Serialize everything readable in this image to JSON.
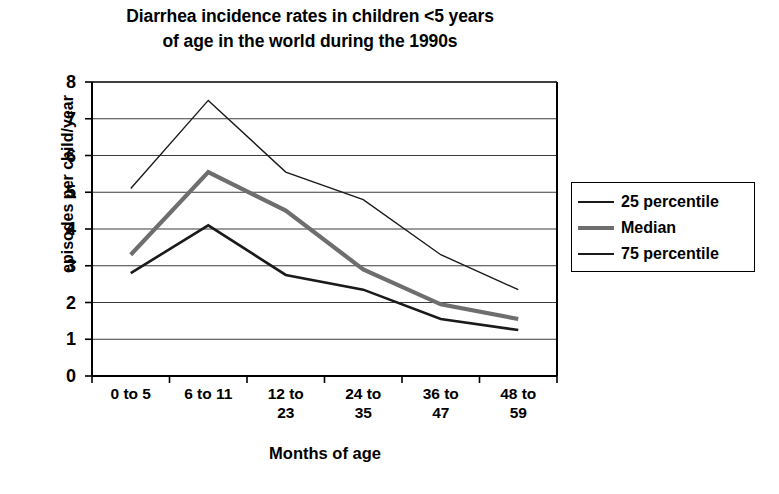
{
  "chart_data": {
    "type": "line",
    "title": "Diarrhea incidence rates in children <5 years\nof age in the world during the 1990s",
    "xlabel": "Months of age",
    "ylabel": "episodes per child/year",
    "categories": [
      "0 to 5",
      "6 to 11",
      "12 to\n23",
      "24 to\n35",
      "36 to\n47",
      "48 to\n59"
    ],
    "categories_plain": [
      "0 to 5",
      "6 to 11",
      "12 to 23",
      "24 to 35",
      "36 to 47",
      "48 to 59"
    ],
    "series": [
      {
        "name": "25 percentile",
        "values": [
          5.1,
          7.5,
          5.55,
          4.8,
          3.3,
          2.35
        ],
        "color": "#1a1a1a",
        "width": 1.4
      },
      {
        "name": "Median",
        "values": [
          3.3,
          5.55,
          4.5,
          2.9,
          1.95,
          1.55
        ],
        "color": "#6e6e6e",
        "width": 4.2
      },
      {
        "name": "75 percentile",
        "values": [
          2.8,
          4.1,
          2.75,
          2.35,
          1.55,
          1.25
        ],
        "color": "#1a1a1a",
        "width": 2.6
      }
    ],
    "ylim": [
      0,
      8
    ],
    "yticks": [
      0,
      1,
      2,
      3,
      4,
      5,
      6,
      7,
      8
    ],
    "ytick_labels": [
      "0",
      "1",
      "2",
      "3",
      "4",
      "5",
      "6",
      "7",
      "8"
    ],
    "grid": true,
    "grid_axis": "y",
    "legend_position": "right-outside",
    "legend_entries": [
      "25 percentile",
      "Median",
      "75 percentile"
    ]
  },
  "colors": {
    "axis": "#000000",
    "grid": "#3c3c3c",
    "background": "#ffffff",
    "median_line": "#6e6e6e",
    "percentile_line": "#1a1a1a"
  }
}
